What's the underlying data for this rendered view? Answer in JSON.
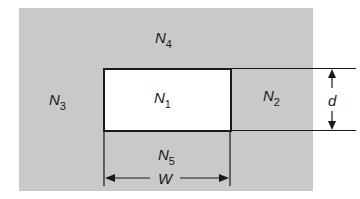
{
  "diagram": {
    "regions": {
      "n1": {
        "letter": "N",
        "sub": "1"
      },
      "n2": {
        "letter": "N",
        "sub": "2"
      },
      "n3": {
        "letter": "N",
        "sub": "3"
      },
      "n4": {
        "letter": "N",
        "sub": "4"
      },
      "n5": {
        "letter": "N",
        "sub": "5"
      }
    },
    "dimensions": {
      "height_label": "d",
      "width_label": "W"
    },
    "colors": {
      "medium": "#c9c9c9",
      "core": "#ffffff",
      "lines": "#1a1a1a"
    }
  }
}
